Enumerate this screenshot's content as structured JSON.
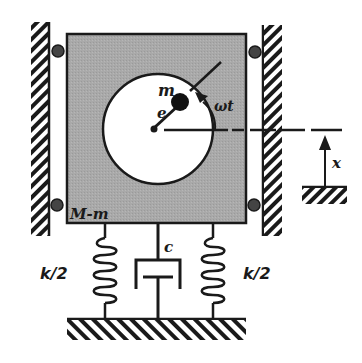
{
  "diagram": {
    "labels": {
      "unbalanced_mass": "m",
      "eccentricity": "e",
      "angle": "ωt",
      "main_mass": "M-m",
      "damping": "c",
      "spring_left": "k/2",
      "spring_right": "k/2",
      "displacement": "x"
    },
    "colors": {
      "block_fill": "#a8a8a8",
      "line": "#1a1a1a",
      "rotor_fill": "#ffffff",
      "background": "#ffffff"
    },
    "components": [
      {
        "name": "left-wall",
        "type": "fixed-support"
      },
      {
        "name": "right-wall",
        "type": "fixed-support"
      },
      {
        "name": "main-block",
        "label": "M-m"
      },
      {
        "name": "rotor-disk"
      },
      {
        "name": "eccentric-mass",
        "label": "m"
      },
      {
        "name": "left-spring",
        "label": "k/2"
      },
      {
        "name": "right-spring",
        "label": "k/2"
      },
      {
        "name": "damper",
        "label": "c"
      },
      {
        "name": "ground",
        "type": "fixed-support"
      },
      {
        "name": "displacement-reference",
        "label": "x"
      }
    ]
  }
}
